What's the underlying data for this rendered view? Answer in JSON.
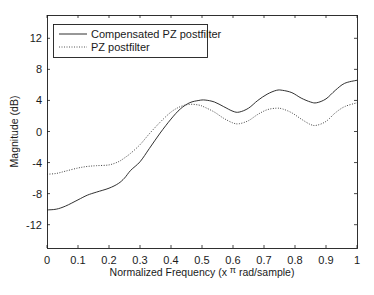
{
  "chart_data": {
    "type": "line",
    "title": "",
    "xlabel": "Normalized Frequency (x π rad/sample)",
    "xlabel_parts": {
      "before": "Normalized Frequency  (x ",
      "pi": "π",
      "after": " rad/sample)"
    },
    "ylabel": "Magnitude (dB)",
    "xlim": [
      0,
      1
    ],
    "ylim": [
      -15,
      15
    ],
    "xticks": [
      0,
      0.1,
      0.2,
      0.3,
      0.4,
      0.5,
      0.6,
      0.7,
      0.8,
      0.9,
      1
    ],
    "xtick_labels": [
      "0",
      "0.1",
      "0.2",
      "0.3",
      "0.4",
      "0.5",
      "0.6",
      "0.7",
      "0.8",
      "0.9",
      "1"
    ],
    "yticks": [
      12,
      8,
      4,
      0,
      -4,
      -8,
      -12
    ],
    "ytick_labels": [
      "12",
      "8",
      "4",
      "0",
      "-4",
      "-8",
      "-12"
    ],
    "grid": false,
    "legend_position": "upper left",
    "series": [
      {
        "name": "Compensated PZ postfilter",
        "style": "solid",
        "color": "#1a1a1a",
        "x": [
          0,
          0.03,
          0.06,
          0.1,
          0.13,
          0.16,
          0.2,
          0.23,
          0.25,
          0.27,
          0.3,
          0.33,
          0.365,
          0.4,
          0.43,
          0.46,
          0.49,
          0.51,
          0.54,
          0.57,
          0.6,
          0.62,
          0.65,
          0.68,
          0.71,
          0.74,
          0.76,
          0.79,
          0.82,
          0.85,
          0.87,
          0.9,
          0.93,
          0.96,
          1
        ],
        "values": [
          -10.1,
          -10.0,
          -9.6,
          -8.8,
          -8.2,
          -7.8,
          -7.3,
          -6.7,
          -6.0,
          -5.0,
          -3.9,
          -2.2,
          -0.2,
          1.6,
          2.9,
          3.7,
          4.0,
          4.05,
          3.8,
          3.2,
          2.6,
          2.5,
          3.0,
          4.0,
          4.8,
          5.3,
          5.3,
          5.0,
          4.3,
          3.8,
          3.7,
          4.2,
          5.3,
          6.2,
          6.6
        ]
      },
      {
        "name": "PZ postfilter",
        "style": "dotted",
        "color": "#444444",
        "x": [
          0,
          0.03,
          0.06,
          0.1,
          0.13,
          0.16,
          0.2,
          0.23,
          0.25,
          0.27,
          0.3,
          0.33,
          0.365,
          0.4,
          0.43,
          0.46,
          0.49,
          0.51,
          0.54,
          0.57,
          0.6,
          0.62,
          0.65,
          0.68,
          0.71,
          0.74,
          0.76,
          0.79,
          0.82,
          0.85,
          0.87,
          0.9,
          0.93,
          0.96,
          1
        ],
        "values": [
          -5.5,
          -5.4,
          -5.1,
          -4.7,
          -4.5,
          -4.4,
          -4.3,
          -3.9,
          -3.4,
          -2.8,
          -1.7,
          -0.3,
          1.2,
          2.5,
          3.2,
          3.5,
          3.4,
          3.1,
          2.5,
          1.7,
          1.1,
          1.0,
          1.4,
          2.2,
          2.8,
          3.0,
          2.9,
          2.4,
          1.6,
          0.9,
          0.8,
          1.3,
          2.4,
          3.2,
          3.7
        ]
      }
    ]
  },
  "layout": {
    "plot_left": 47,
    "plot_top": 15,
    "plot_right": 357,
    "plot_bottom": 248,
    "legend_box": {
      "x": 53,
      "y": 24,
      "w": 154,
      "h": 33
    }
  },
  "colors": {
    "axis": "#1a1a1a",
    "background": "#ffffff"
  }
}
